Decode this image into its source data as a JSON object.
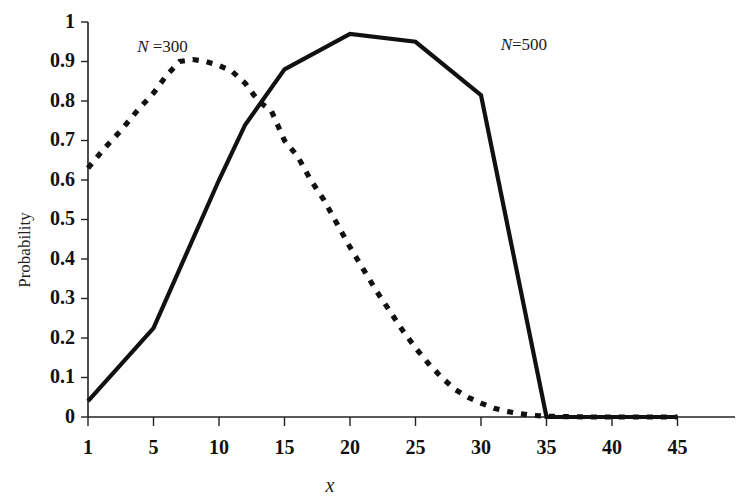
{
  "chart_data": {
    "type": "line",
    "title": "",
    "xlabel": "x",
    "ylabel": "Probability",
    "xlim": [
      0,
      46
    ],
    "ylim": [
      0,
      1
    ],
    "grid": false,
    "legend_position": "inline-annotation",
    "xticks": [
      "1",
      "5",
      "10",
      "15",
      "20",
      "25",
      "30",
      "35",
      "40",
      "45"
    ],
    "xtick_values": [
      1,
      5,
      10,
      15,
      20,
      25,
      30,
      35,
      40,
      45
    ],
    "yticks": [
      "0",
      "0.1",
      "0.2",
      "0.3",
      "0.4",
      "0.5",
      "0.6",
      "0.7",
      "0.8",
      "0.9",
      "1"
    ],
    "ytick_values": [
      0,
      0.1,
      0.2,
      0.3,
      0.4,
      0.5,
      0.6,
      0.7,
      0.8,
      0.9,
      1
    ],
    "series": [
      {
        "name": "N = 300",
        "style": "dashed",
        "color": "#111111",
        "label_text_prefix": "N",
        "label_text_suffix": " =300",
        "x": [
          1,
          2,
          3,
          4,
          5,
          6,
          7,
          8,
          9,
          10,
          11,
          12,
          13,
          14,
          15,
          16,
          17,
          18,
          19,
          20,
          21,
          22,
          23,
          24,
          25,
          26,
          27,
          28,
          29,
          30,
          31,
          32,
          33,
          34,
          35,
          36,
          37,
          38,
          39,
          40,
          41,
          42,
          43,
          44,
          45
        ],
        "values": [
          0.63,
          0.68,
          0.725,
          0.775,
          0.82,
          0.865,
          0.9,
          0.905,
          0.9,
          0.89,
          0.875,
          0.845,
          0.8,
          0.775,
          0.7,
          0.66,
          0.6,
          0.55,
          0.49,
          0.43,
          0.375,
          0.32,
          0.27,
          0.22,
          0.175,
          0.135,
          0.1,
          0.07,
          0.05,
          0.035,
          0.022,
          0.014,
          0.008,
          0.004,
          0.002,
          0.001,
          0.001,
          0.0,
          0.0,
          0.0,
          0.0,
          0.0,
          0.0,
          0.0,
          0.0
        ]
      },
      {
        "name": "N=500",
        "style": "solid",
        "color": "#111111",
        "label_text_prefix": "N",
        "label_text_suffix": "=500",
        "x": [
          1,
          5,
          10,
          12,
          15,
          20,
          25,
          30,
          35,
          40,
          45
        ],
        "values": [
          0.04,
          0.225,
          0.6,
          0.74,
          0.88,
          0.97,
          0.95,
          0.815,
          0.0,
          0.0,
          0.0
        ]
      }
    ],
    "annotations": [
      {
        "text": "N =300",
        "x": 4.0,
        "y": 0.925
      },
      {
        "text": "N=500",
        "x": 31.5,
        "y": 0.93
      }
    ]
  }
}
